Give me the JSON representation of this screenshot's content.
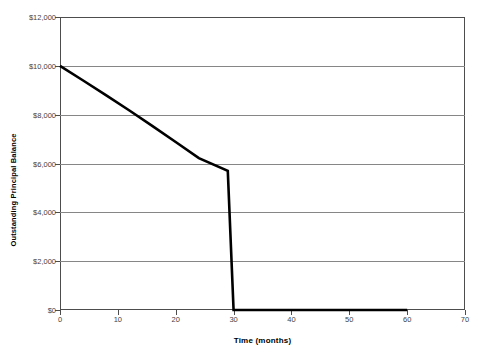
{
  "chart_data": {
    "type": "line",
    "title": "",
    "subtitle": "",
    "xlabel": "Time (months)",
    "ylabel": "Outstanding Principal Balance",
    "xlim": [
      0,
      70
    ],
    "ylim": [
      0,
      12000
    ],
    "grid": true,
    "grid_axis": "y",
    "legend": false,
    "legend_position": "none",
    "x_ticks": [
      0,
      10,
      20,
      30,
      40,
      50,
      60,
      70
    ],
    "x_tick_labels": [
      "0",
      "10",
      "20",
      "30",
      "40",
      "50",
      "60",
      "70"
    ],
    "y_ticks": [
      0,
      2000,
      4000,
      6000,
      8000,
      10000,
      12000
    ],
    "y_tick_labels": [
      "$0",
      "$2,000",
      "$4,000",
      "$6,000",
      "$8,000",
      "$10,000",
      "$12,000"
    ],
    "series": [
      {
        "name": "Outstanding Principal Balance",
        "color": "#000000",
        "line_width": 2.6,
        "marker": "none",
        "x": [
          0,
          4,
          8,
          12,
          16,
          20,
          24,
          29,
          30,
          35,
          40,
          45,
          50,
          55,
          60
        ],
        "values": [
          10000,
          9400,
          8790,
          8170,
          7530,
          6880,
          6220,
          5700,
          0,
          0,
          0,
          0,
          0,
          0,
          0
        ]
      }
    ],
    "annotations": [
      {
        "label": "payoff-point",
        "x": 30,
        "y": 0
      },
      {
        "label": "balloon-drop-start",
        "x": 29,
        "y": 5700
      },
      {
        "label": "start-balance",
        "x": 0,
        "y": 10000
      }
    ],
    "colors": {
      "line": "#000000",
      "grid": "#868686",
      "axis": "#4d4d4d",
      "tick_text": "#3f3f3f",
      "title_text": "#000000",
      "background": "#ffffff"
    }
  }
}
